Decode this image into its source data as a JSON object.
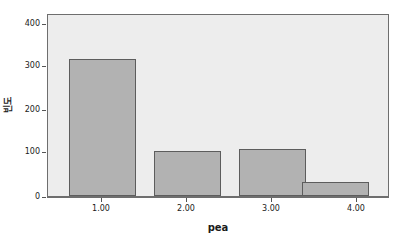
{
  "chart_data": {
    "type": "bar",
    "title": "",
    "subtitle": "",
    "xlabel": "pea",
    "ylabel": "빈도",
    "categories": [
      "1.00",
      "2.00",
      "3.00",
      "4.00"
    ],
    "values": [
      314,
      104,
      109,
      32
    ],
    "ylim": [
      0,
      420
    ],
    "yticks": [
      0,
      100,
      200,
      300,
      400
    ],
    "ytick_labels": [
      "0",
      "100",
      "200",
      "300",
      "400"
    ],
    "grid": false,
    "legend": false,
    "legend_position": "none",
    "colors": {
      "bar_fill": "#b2b2b2",
      "bar_edge": "#5d5d5d",
      "plot_background": "#ededed",
      "canvas_background": "#ffffff",
      "axis_line": "#6e6e6e",
      "text": "#1b1b1b"
    }
  },
  "axes": {
    "y": {
      "title": "빈도",
      "ticks": [
        {
          "label": "400",
          "value": 400
        },
        {
          "label": "300",
          "value": 300
        },
        {
          "label": "200",
          "value": 200
        },
        {
          "label": "100",
          "value": 100
        },
        {
          "label": "0",
          "value": 0
        }
      ]
    },
    "x": {
      "title": "pea",
      "ticks": [
        {
          "label": "1.00",
          "value": 1
        },
        {
          "label": "2.00",
          "value": 2
        },
        {
          "label": "3.00",
          "value": 3
        },
        {
          "label": "4.00",
          "value": 4
        }
      ]
    }
  }
}
